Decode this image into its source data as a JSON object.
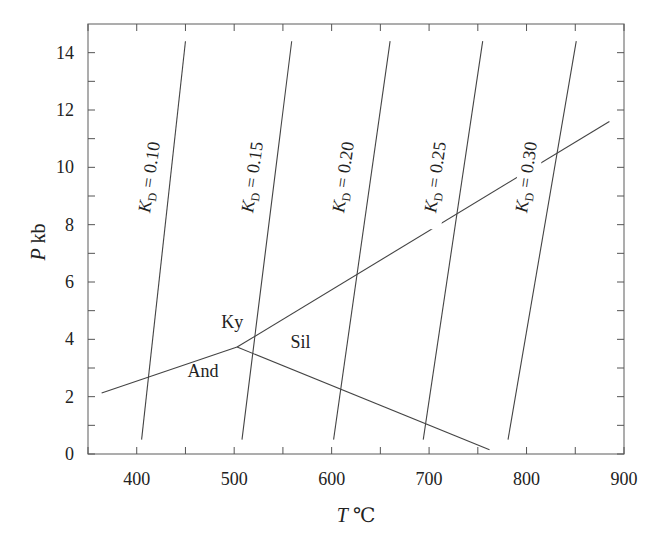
{
  "chart_data": {
    "type": "line",
    "title": "",
    "xlabel": "T ℃",
    "ylabel": "P kb",
    "xlim": [
      350,
      900
    ],
    "ylim": [
      0,
      15
    ],
    "x_ticks": [
      400,
      500,
      600,
      700,
      800,
      900
    ],
    "x_minor_ticks": [
      350,
      400,
      450,
      500,
      550,
      600,
      650,
      700,
      750,
      800,
      850,
      900
    ],
    "y_ticks": [
      0,
      2,
      4,
      6,
      8,
      10,
      12,
      14
    ],
    "y_minor_ticks": [
      1,
      3,
      5,
      7,
      9,
      11,
      13
    ],
    "grid": false,
    "legend": null,
    "series": [
      {
        "name": "K_D = 0.10",
        "label_main": "K",
        "label_sub": "D",
        "label_rest": " = 0.10",
        "points": [
          [
            405,
            0.5
          ],
          [
            450,
            14.4
          ]
        ]
      },
      {
        "name": "K_D = 0.15",
        "label_main": "K",
        "label_sub": "D",
        "label_rest": " = 0.15",
        "points": [
          [
            508,
            0.5
          ],
          [
            559,
            14.4
          ]
        ]
      },
      {
        "name": "K_D = 0.20",
        "label_main": "K",
        "label_sub": "D",
        "label_rest": " = 0.20",
        "points": [
          [
            602,
            0.5
          ],
          [
            660,
            14.4
          ]
        ]
      },
      {
        "name": "K_D = 0.25",
        "label_main": "K",
        "label_sub": "D",
        "label_rest": " = 0.25",
        "points": [
          [
            694,
            0.5
          ],
          [
            755,
            14.4
          ]
        ]
      },
      {
        "name": "K_D = 0.30",
        "label_main": "K",
        "label_sub": "D",
        "label_rest": " = 0.30",
        "points": [
          [
            781,
            0.5
          ],
          [
            851,
            14.4
          ]
        ]
      },
      {
        "name": "Ky-And boundary",
        "points": [
          [
            364,
            2.13
          ],
          [
            503,
            3.73
          ]
        ]
      },
      {
        "name": "Ky-Sil boundary",
        "points": [
          [
            503,
            3.73
          ],
          [
            885,
            11.6
          ]
        ]
      },
      {
        "name": "And-Sil boundary",
        "points": [
          [
            503,
            3.73
          ],
          [
            762,
            0.15
          ]
        ]
      }
    ],
    "annotations": [
      {
        "text": "Ky",
        "x": 498,
        "y": 4.4
      },
      {
        "text": "Sil",
        "x": 568,
        "y": 3.7
      },
      {
        "text": "And",
        "x": 468,
        "y": 2.7
      }
    ]
  }
}
